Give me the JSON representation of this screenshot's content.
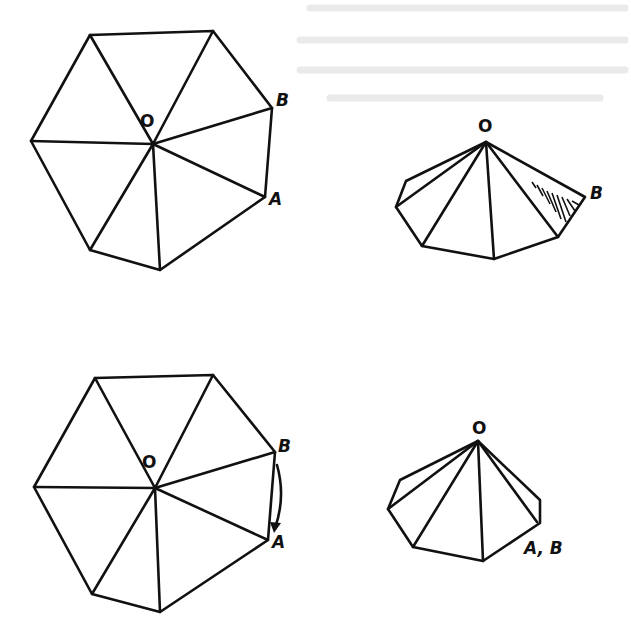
{
  "figure": {
    "panels": [
      {
        "id": "flat-top",
        "labels": {
          "center": "O",
          "point_b": "B",
          "point_a": "A"
        }
      },
      {
        "id": "cone-top",
        "labels": {
          "apex": "O",
          "point_b": "B"
        }
      },
      {
        "id": "flat-bottom",
        "labels": {
          "center": "O",
          "point_b": "B",
          "point_a": "A"
        }
      },
      {
        "id": "cone-bottom",
        "labels": {
          "apex": "O",
          "point_ab": "A, B"
        }
      }
    ]
  }
}
